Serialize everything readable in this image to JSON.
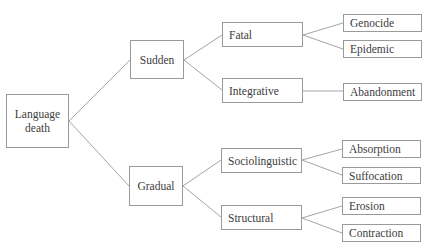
{
  "diagram": {
    "type": "tree",
    "root": {
      "id": "language-death",
      "label": "Language\ndeath"
    },
    "level1": [
      {
        "id": "sudden",
        "label": "Sudden"
      },
      {
        "id": "gradual",
        "label": "Gradual"
      }
    ],
    "level2": [
      {
        "id": "fatal",
        "label": "Fatal",
        "parent": "sudden"
      },
      {
        "id": "integrative",
        "label": "Integrative",
        "parent": "sudden"
      },
      {
        "id": "sociolinguistic",
        "label": "Sociolinguistic",
        "parent": "gradual"
      },
      {
        "id": "structural",
        "label": "Structural",
        "parent": "gradual"
      }
    ],
    "level3": [
      {
        "id": "genocide",
        "label": "Genocide",
        "parent": "fatal"
      },
      {
        "id": "epidemic",
        "label": "Epidemic",
        "parent": "fatal"
      },
      {
        "id": "abandonment",
        "label": "Abandonment",
        "parent": "integrative"
      },
      {
        "id": "absorption",
        "label": "Absorption",
        "parent": "sociolinguistic"
      },
      {
        "id": "suffocation",
        "label": "Suffocation",
        "parent": "sociolinguistic"
      },
      {
        "id": "erosion",
        "label": "Erosion",
        "parent": "structural"
      },
      {
        "id": "contraction",
        "label": "Contraction",
        "parent": "structural"
      }
    ],
    "colors": {
      "border": "#9a9a9a",
      "text": "#3c3c3c",
      "background": "#ffffff"
    }
  }
}
